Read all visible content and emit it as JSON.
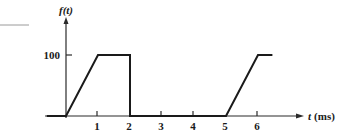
{
  "chart_data": {
    "type": "line",
    "title": "",
    "xlabel": "t (ms)",
    "ylabel": "f(t)",
    "xlabel_var": "t",
    "xlabel_unit": "(ms)",
    "ylabel_var": "f",
    "ylabel_arg": "(t)",
    "x_ticks": [
      "1",
      "2",
      "3",
      "4",
      "5",
      "6"
    ],
    "y_ticks": [
      "100"
    ],
    "xlim": [
      -0.6,
      7.3
    ],
    "ylim": [
      0,
      120
    ],
    "grid": false,
    "legend": null,
    "series": [
      {
        "name": "f(t)",
        "points": [
          {
            "x": -0.6,
            "y": 0
          },
          {
            "x": 0,
            "y": 0
          },
          {
            "x": 1,
            "y": 100
          },
          {
            "x": 2,
            "y": 100
          },
          {
            "x": 2,
            "y": 0
          },
          {
            "x": 5,
            "y": 0
          },
          {
            "x": 6,
            "y": 100
          },
          {
            "x": 6.45,
            "y": 100
          }
        ]
      }
    ]
  },
  "colors": {
    "line": "#1a1a1a",
    "axis": "#2a2a2a",
    "stray_mark": "#9a9a9a"
  }
}
